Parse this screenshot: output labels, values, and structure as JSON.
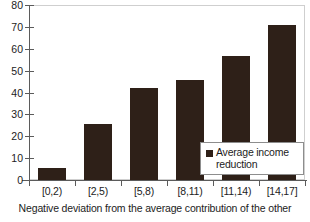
{
  "chart_data": {
    "type": "bar",
    "title": "",
    "subtitle": "",
    "categories": [
      "[0,2)",
      "[2,5)",
      "[5,8)",
      "[8,11)",
      "[11,14)",
      "[14,17]"
    ],
    "values": [
      5.5,
      25.5,
      42,
      45.5,
      56.5,
      71
    ],
    "series": [
      {
        "name": "Average income reduction",
        "values": [
          5.5,
          25.5,
          42,
          45.5,
          56.5,
          71
        ],
        "color": "#2e2018"
      }
    ],
    "xlabel": "",
    "ylabel": "",
    "ylim": [
      0,
      80
    ],
    "ytick_labels": [
      "80",
      "70",
      "60",
      "50",
      "40",
      "30",
      "20",
      "10",
      "0"
    ],
    "ytick_values": [
      80,
      70,
      60,
      50,
      40,
      30,
      20,
      10,
      0
    ],
    "ytick_step": 10,
    "grid": false,
    "legend_position": "inside-right",
    "legend_entries": [
      "Average income reduction"
    ],
    "caption": "Negative deviation from the average contribution of the other",
    "annotations": []
  },
  "legend": {
    "line1": "Average income",
    "line2": "reduction",
    "full": "Average income reduction",
    "swatch_color": "#2e2018"
  },
  "caption": {
    "text": "Negative deviation from the average contribution of the other"
  },
  "colors": {
    "bar": "#2e2018",
    "axis": "#5b5b5b",
    "plot_border": "#cfcfcf",
    "text": "#1c1c1c",
    "background": "#ffffff"
  }
}
